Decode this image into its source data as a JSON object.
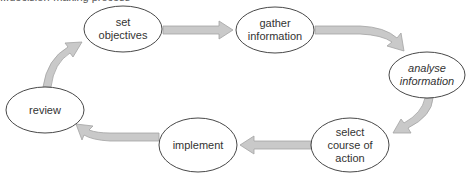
{
  "caption": {
    "text": "...decision-making process",
    "clipped": true
  },
  "colors": {
    "background": "#ffffff",
    "node_stroke": "#333333",
    "node_fill": "#ffffff",
    "arrow_fill": "#c9c9c9",
    "arrow_stroke": "#a3a3a3",
    "text": "#333333"
  },
  "nodes": [
    {
      "id": "set-objectives",
      "label_lines": [
        "set",
        "objectives"
      ],
      "italic": false,
      "cx": 123,
      "cy": 29,
      "rx": 39,
      "ry": 23
    },
    {
      "id": "gather-information",
      "label_lines": [
        "gather",
        "information"
      ],
      "italic": false,
      "cx": 275,
      "cy": 30,
      "rx": 39,
      "ry": 23
    },
    {
      "id": "analyse-information",
      "label_lines": [
        "analyse",
        "information"
      ],
      "italic": true,
      "cx": 427,
      "cy": 75,
      "rx": 38,
      "ry": 23
    },
    {
      "id": "select-course-of-action",
      "label_lines": [
        "select",
        "course of",
        "action"
      ],
      "italic": false,
      "cx": 350,
      "cy": 145,
      "rx": 39,
      "ry": 27
    },
    {
      "id": "implement",
      "label_lines": [
        "implement"
      ],
      "italic": false,
      "cx": 198,
      "cy": 145,
      "rx": 39,
      "ry": 27
    },
    {
      "id": "review",
      "label_lines": [
        "review"
      ],
      "italic": false,
      "cx": 45,
      "cy": 110,
      "rx": 39,
      "ry": 23
    }
  ],
  "labels": {
    "set_objectives": "set\nobjectives",
    "set_objectives_l1": "set",
    "set_objectives_l2": "objectives",
    "gather_information_l1": "gather",
    "gather_information_l2": "information",
    "analyse_information_l1": "analyse",
    "analyse_information_l2": "information",
    "select_course_l1": "select",
    "select_course_l2": "course of",
    "select_course_l3": "action",
    "implement": "implement",
    "review": "review"
  },
  "edges": [
    {
      "from": "set-objectives",
      "to": "gather-information",
      "shape": "straight"
    },
    {
      "from": "gather-information",
      "to": "analyse-information",
      "shape": "curved"
    },
    {
      "from": "analyse-information",
      "to": "select-course-of-action",
      "shape": "curved"
    },
    {
      "from": "select-course-of-action",
      "to": "implement",
      "shape": "straight"
    },
    {
      "from": "implement",
      "to": "review",
      "shape": "curved"
    },
    {
      "from": "review",
      "to": "set-objectives",
      "shape": "curved"
    }
  ]
}
